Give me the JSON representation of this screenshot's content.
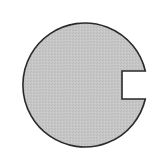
{
  "diagram": {
    "shape": "notched-circle",
    "fill_color": "#c4c4c4",
    "stroke_color": "#2a2a2a",
    "background": "#ffffff",
    "circle": {
      "cx": 84.5,
      "cy": 84,
      "r": 62
    },
    "notch": {
      "x_inner": 122,
      "y_top": 71,
      "y_bottom": 99
    }
  }
}
